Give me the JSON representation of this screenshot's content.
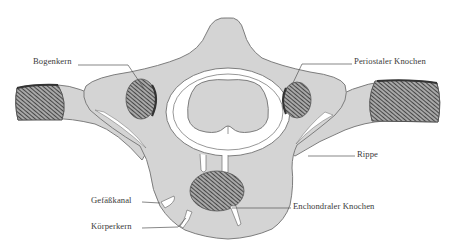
{
  "figure": {
    "colors": {
      "bone_fill": "#d4d4d4",
      "outline": "#7d7d7d",
      "hatch_dark": "#3c3c3c",
      "hatch_light": "#a8a8a8",
      "canal_white": "#ffffff",
      "label_text": "#3a3a3a",
      "leader_line": "#555555"
    }
  },
  "labels": {
    "bogenkern": "Bogenkern",
    "periostaler_knochen": "Periostaler Knochen",
    "rippe": "Rippe",
    "gefaesskanal": "Gefäßkanal",
    "koerperkern": "Körperkern",
    "enchondraler_knochen": "Enchondraler Knochen"
  }
}
